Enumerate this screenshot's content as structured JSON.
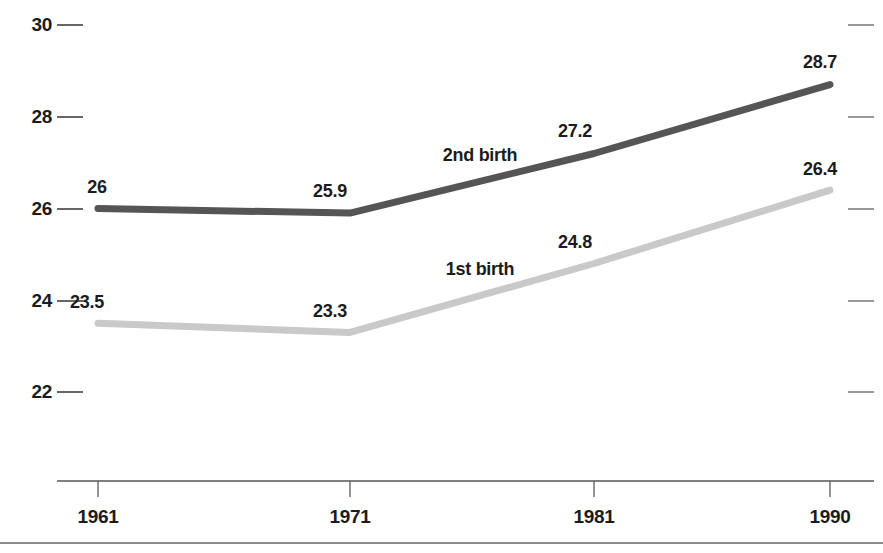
{
  "chart_data": {
    "type": "line",
    "title": "",
    "subtitle": "",
    "xlabel": "",
    "ylabel": "",
    "categories": [
      "1961",
      "1971",
      "1981",
      "1990"
    ],
    "x": [
      1961,
      1971,
      1981,
      1990
    ],
    "series": [
      {
        "name": "2nd birth",
        "color": "#555555",
        "values": [
          26,
          25.9,
          27.2,
          28.7
        ],
        "value_labels": [
          "26",
          "25.9",
          "27.2",
          "28.7"
        ]
      },
      {
        "name": "1st birth",
        "color": "#c9c9c9",
        "values": [
          23.5,
          23.3,
          24.8,
          26.4
        ],
        "value_labels": [
          "23.5",
          "23.3",
          "24.8",
          "26.4"
        ]
      }
    ],
    "ylim": [
      21.0,
      30.6
    ],
    "y_ticks": [
      30,
      28,
      26,
      24,
      22
    ],
    "y_tick_labels": [
      "30",
      "28",
      "26",
      "24",
      "22"
    ],
    "grid": false,
    "legend": "inline-labels",
    "axis_color": "#555555"
  },
  "axes": {
    "y_tick_labels": [
      "30",
      "28",
      "26",
      "24",
      "22"
    ],
    "x_tick_labels": [
      "1961",
      "1971",
      "1981",
      "1990"
    ]
  },
  "series_labels": {
    "upper": "2nd birth",
    "lower": "1st birth"
  },
  "upper_values": {
    "v1961": "26",
    "v1971": "25.9",
    "v1981": "27.2",
    "v1990": "28.7"
  },
  "lower_values": {
    "v1961": "23.5",
    "v1971": "23.3",
    "v1981": "24.8",
    "v1990": "26.4"
  }
}
